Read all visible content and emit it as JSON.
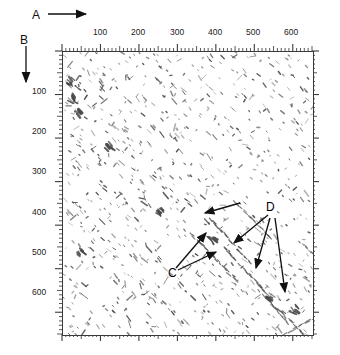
{
  "figure": {
    "type": "dotplot",
    "background_color": "#ffffff",
    "frame_color": "#3a3a3a",
    "dot_color": "#4a4a4a",
    "annotation_color": "#000000"
  },
  "axes": {
    "horizontal": {
      "label": "A",
      "arrow": "right-arrow-icon",
      "position": "top",
      "min": 0,
      "max": 650,
      "major_tick_interval": 100,
      "minor_tick_interval": 10,
      "tick_labels": [
        "100",
        "200",
        "300",
        "400",
        "500",
        "600"
      ],
      "tick_values": [
        100,
        200,
        300,
        400,
        500,
        600
      ]
    },
    "vertical": {
      "label": "B",
      "arrow": "down-arrow-icon",
      "position": "left",
      "min": 0,
      "max": 650,
      "major_tick_interval": 100,
      "minor_tick_interval": 10,
      "tick_labels": [
        "100",
        "200",
        "300",
        "400",
        "500",
        "600"
      ],
      "tick_values": [
        100,
        200,
        300,
        400,
        500,
        600
      ]
    },
    "right": {
      "ticks_only": true,
      "labels": []
    },
    "bottom": {
      "ticks_only": true,
      "labels": []
    }
  },
  "annotations": [
    {
      "id": "C",
      "label": "C",
      "x": 175,
      "y": 273,
      "arrow_count": 2
    },
    {
      "id": "D",
      "label": "D",
      "x": 271,
      "y": 209,
      "arrow_count": 3
    }
  ],
  "chart_data": {
    "type": "scatter",
    "title": "",
    "xlabel": "A",
    "ylabel": "B",
    "xlim": [
      0,
      650
    ],
    "ylim": [
      0,
      650
    ],
    "y_axis_inverted": true,
    "grid": false,
    "legend": false,
    "marker": "short-diagonal-dash",
    "series": [
      {
        "name": "match-segments",
        "note": "Dense field of short diagonal dashes distributed across the whole matrix",
        "approx_point_count": 900
      },
      {
        "name": "feature-C-diagonals",
        "note": "Longer diagonal repeat segments indicated by label C arrows",
        "points": [
          [
            350,
            430
          ],
          [
            392,
            470
          ],
          [
            330,
            480
          ]
        ]
      },
      {
        "name": "feature-D-diagonals",
        "note": "Longer diagonal repeat segments indicated by label D arrows",
        "points": [
          [
            430,
            400
          ],
          [
            455,
            520
          ],
          [
            530,
            600
          ],
          [
            575,
            640
          ]
        ]
      }
    ]
  }
}
